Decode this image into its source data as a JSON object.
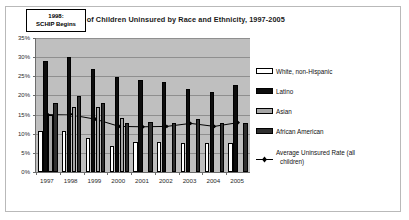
{
  "chart_data": {
    "type": "bar",
    "title": "Percent of Children Uninsured by Race and Ethnicity, 1997-2005",
    "xlabel": "",
    "ylabel": "",
    "ylim": [
      0,
      35
    ],
    "ytick_labels": [
      "0%",
      "5%",
      "10%",
      "15%",
      "20%",
      "25%",
      "30%",
      "35%"
    ],
    "ytick_values": [
      0,
      5,
      10,
      15,
      20,
      25,
      30,
      35
    ],
    "grid": true,
    "legend_position": "right",
    "categories": [
      "1997",
      "1998",
      "1999",
      "2000",
      "2001",
      "2002",
      "2003",
      "2004",
      "2005"
    ],
    "series": [
      {
        "name": "White, non-Hispanic",
        "type": "bar",
        "color": "#ffffff",
        "values": [
          10.8,
          10.8,
          8.8,
          6.9,
          7.8,
          7.8,
          7.6,
          7.6,
          7.6
        ]
      },
      {
        "name": "Latino",
        "type": "bar",
        "color": "#0d0d0d",
        "values": [
          29.1,
          30.0,
          27.0,
          24.9,
          24.1,
          23.4,
          21.8,
          20.8,
          22.7
        ]
      },
      {
        "name": "Asian",
        "type": "bar",
        "color": "#a5a5a5",
        "values": [
          15.0,
          16.9,
          17.0,
          14.0,
          null,
          null,
          null,
          null,
          null
        ]
      },
      {
        "name": "African American",
        "type": "bar",
        "color": "#2f2f2f",
        "values": [
          18.0,
          19.9,
          17.9,
          12.9,
          13.0,
          12.9,
          13.8,
          12.8,
          12.9
        ]
      },
      {
        "name": "Average Uninsured Rate (all children)",
        "type": "line",
        "color": "#000000",
        "values": [
          15.0,
          14.9,
          13.8,
          11.9,
          11.8,
          11.9,
          12.7,
          11.9,
          12.9
        ]
      }
    ],
    "annotations": [
      {
        "name": "schip-annotation",
        "line1": "1998:",
        "line2": "SCHIP Begins"
      }
    ],
    "legend_labels": [
      "White, non-Hispanic",
      "Latino",
      "Asian",
      "African American",
      "Average Uninsured Rate (all",
      "children)"
    ]
  }
}
